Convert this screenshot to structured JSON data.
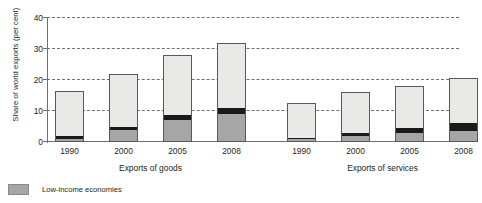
{
  "figure": {
    "title": "Figure 1  Share of developing and transition economies in world exports of goods and services"
  },
  "legend": [
    {
      "key": "low",
      "label": "Low-income economies",
      "color": "#a6a6a6"
    }
  ],
  "axis": {
    "y_title": "Share of world exports (per cent)",
    "y_ticks": [
      "0",
      "10",
      "20",
      "30",
      "40"
    ]
  },
  "groups": [
    {
      "name": "Exports of goods"
    },
    {
      "name": "Exports of services"
    }
  ],
  "chart_data": {
    "type": "bar",
    "stacked": true,
    "title": "Figure 1  Share of developing and transition economies in world exports of goods and services",
    "xlabel": "",
    "ylabel": "Share of world exports (per cent)",
    "ylim": [
      0,
      40
    ],
    "yticks": [
      0,
      10,
      20,
      30,
      40
    ],
    "grid": "horizontal-dashed",
    "legend_position": "below-left",
    "panels": [
      {
        "name": "Exports of goods",
        "categories": [
          "1990",
          "2000",
          "2005",
          "2008"
        ],
        "series": [
          {
            "name": "Low-income economies",
            "color": "#a6a6a6",
            "values": [
              1.1,
              3.9,
              7.0,
              9.0
            ]
          },
          {
            "name": "Middle band",
            "color": "#1a1a1a",
            "values": [
              0.8,
              1.0,
              1.7,
              1.9
            ]
          },
          {
            "name": "Upper segment",
            "color": "#e9e9e7",
            "values": [
              14.6,
              17.1,
              19.3,
              21.1
            ]
          }
        ],
        "totals": [
          16.5,
          22.0,
          28.0,
          32.0
        ]
      },
      {
        "name": "Exports of services",
        "categories": [
          "1990",
          "2000",
          "2005",
          "2008"
        ],
        "series": [
          {
            "name": "Low-income economies",
            "color": "#a6a6a6",
            "values": [
              0.9,
              2.0,
              2.8,
              3.6
            ]
          },
          {
            "name": "Middle band",
            "color": "#1a1a1a",
            "values": [
              0.5,
              0.9,
              1.7,
              2.4
            ]
          },
          {
            "name": "Upper segment",
            "color": "#e9e9e7",
            "values": [
              11.3,
              13.1,
              13.5,
              14.5
            ]
          }
        ],
        "totals": [
          12.7,
          16.0,
          18.0,
          20.5
        ]
      }
    ]
  }
}
